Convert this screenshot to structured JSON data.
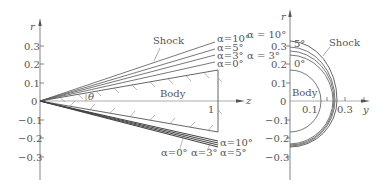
{
  "figure": {
    "left_panel": {
      "axis_vertical_label": "r",
      "axis_horizontal_label": "z",
      "ticks": [
        "0.3",
        "0.2",
        "0.1",
        "0",
        "−0.1",
        "−0.2",
        "−0.3"
      ],
      "z_tick": "1",
      "angle_label": "θ",
      "body_label": "Body",
      "shock_label": "Shock",
      "upper_labels": [
        "α=10°",
        "α = 10°",
        "α=5°",
        "α=3°",
        "α = 3°",
        "α=0°"
      ],
      "lower_labels": [
        "α=10°",
        "α=5°",
        "α=0°",
        "α=3°"
      ]
    },
    "right_panel": {
      "axis_vertical_label": "r",
      "axis_horizontal_label": "y",
      "ticks": [
        "0.3",
        "0.2",
        "0.1",
        "0",
        "−0.1",
        "−0.2",
        "−0.3"
      ],
      "y_ticks": [
        "0.1",
        "0.3"
      ],
      "body_label": "Body",
      "shock_label": "Shock",
      "labels": [
        "5°",
        "0°"
      ]
    }
  },
  "colors": {
    "line": "#555555",
    "text": "#555555",
    "hatch": "#888888"
  }
}
